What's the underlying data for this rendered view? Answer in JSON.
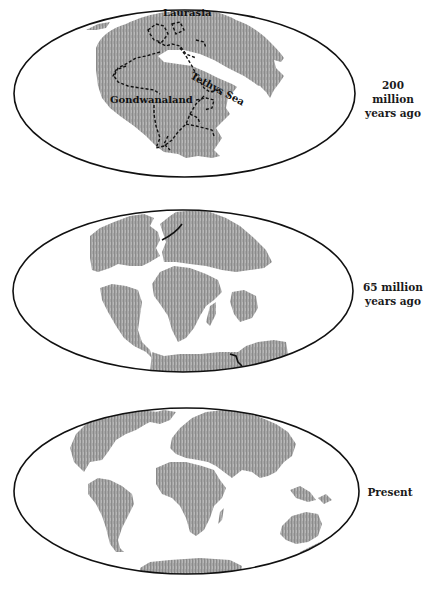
{
  "figure": {
    "colors": {
      "land": "#a3a3a3",
      "land_streak": "#7d7d7d",
      "ocean": "#ffffff",
      "outline": "#111111",
      "boundary": "#111111"
    },
    "panels": [
      {
        "id": "panel-200ma",
        "label_line1": "200 million",
        "label_line2": "years ago",
        "map_labels": {
          "laurasia": "Laurasia",
          "gondwanaland": "Gondwanaland",
          "tethys": "Tethys Sea"
        }
      },
      {
        "id": "panel-65ma",
        "label_line1": "65 million",
        "label_line2": "years ago"
      },
      {
        "id": "panel-present",
        "label_line1": "Present"
      }
    ]
  }
}
